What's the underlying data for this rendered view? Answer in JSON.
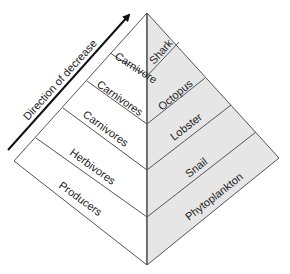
{
  "diagram": {
    "type": "trophic-pyramid",
    "arrow_label": "Direction of decrease",
    "colors": {
      "left_face": "#ffffff",
      "right_face": "#e6e6e6",
      "edge": "#555555",
      "arrow": "#111111",
      "text": "#222222"
    },
    "levels": [
      {
        "trophic": "Carnivore",
        "organism": "Shark"
      },
      {
        "trophic": "Carnivores",
        "organism": "Octopus"
      },
      {
        "trophic": "Carnivores",
        "organism": "Lobster"
      },
      {
        "trophic": "Herbivores",
        "organism": "Snail"
      },
      {
        "trophic": "Producers",
        "organism": "Phytoplankton"
      }
    ]
  }
}
